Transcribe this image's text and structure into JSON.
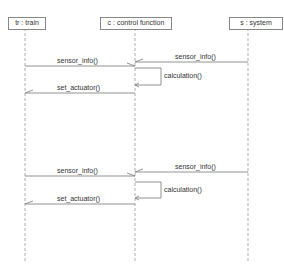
{
  "diagram": {
    "type": "sequence",
    "lifelines": [
      {
        "id": "tr",
        "label": "tr : train"
      },
      {
        "id": "c",
        "label": "c : control function"
      },
      {
        "id": "s",
        "label": "s : system"
      }
    ],
    "messages": [
      {
        "from": "s",
        "to": "c",
        "label": "sensor_info()"
      },
      {
        "from": "tr",
        "to": "c",
        "label": "sensor_info()"
      },
      {
        "from": "c",
        "to": "c",
        "label": "calculation()"
      },
      {
        "from": "c",
        "to": "tr",
        "label": "set_actuator()"
      },
      {
        "from": "s",
        "to": "c",
        "label": "sensor_info()"
      },
      {
        "from": "tr",
        "to": "c",
        "label": "sensor_info()"
      },
      {
        "from": "c",
        "to": "c",
        "label": "calculation()"
      },
      {
        "from": "c",
        "to": "tr",
        "label": "set_actuator()"
      }
    ]
  }
}
